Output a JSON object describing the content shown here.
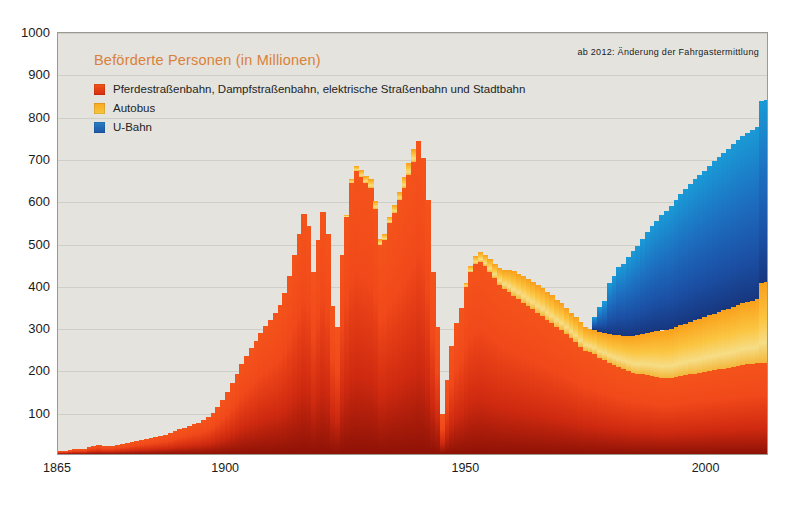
{
  "chart_data": {
    "type": "area",
    "title": "Beförderte Personen (in Millionen)",
    "xlabel": "",
    "ylabel": "",
    "ylim": [
      0,
      1000
    ],
    "xlim": [
      1865,
      2013
    ],
    "grid": true,
    "legend_position": "top-left",
    "annotation": "ab 2012: Änderung der Fahrgastermittlung",
    "y_ticks": [
      1000,
      900,
      800,
      700,
      600,
      500,
      400,
      300,
      200,
      100
    ],
    "x_ticks": [
      1865,
      1900,
      1950,
      2000
    ],
    "colors": {
      "rail": "#ef4c18",
      "bus": "#f9ab25",
      "ubahn": "#1d62b4",
      "plot_background": "#e4e3de",
      "gridline": "#cfcec7",
      "title": "#d98139",
      "text": "#1b1b1b"
    },
    "series": [
      {
        "name": "Pferdestraßenbahn, Dampfstraßenbahn, elektrische Straßenbahn und Stadtbahn",
        "key": "rail",
        "color": "#ef4c18"
      },
      {
        "name": "Autobus",
        "key": "bus",
        "color": "#f9ab25"
      },
      {
        "name": "U-Bahn",
        "key": "ubahn",
        "color": "#1d62b4"
      }
    ],
    "x": [
      1865,
      1866,
      1867,
      1868,
      1869,
      1870,
      1871,
      1872,
      1873,
      1874,
      1875,
      1876,
      1877,
      1878,
      1879,
      1880,
      1881,
      1882,
      1883,
      1884,
      1885,
      1886,
      1887,
      1888,
      1889,
      1890,
      1891,
      1892,
      1893,
      1894,
      1895,
      1896,
      1897,
      1898,
      1899,
      1900,
      1901,
      1902,
      1903,
      1904,
      1905,
      1906,
      1907,
      1908,
      1909,
      1910,
      1911,
      1912,
      1913,
      1914,
      1915,
      1916,
      1917,
      1918,
      1919,
      1920,
      1921,
      1922,
      1923,
      1924,
      1925,
      1926,
      1927,
      1928,
      1929,
      1930,
      1931,
      1932,
      1933,
      1934,
      1935,
      1936,
      1937,
      1938,
      1939,
      1940,
      1941,
      1942,
      1943,
      1944,
      1945,
      1946,
      1947,
      1948,
      1949,
      1950,
      1951,
      1952,
      1953,
      1954,
      1955,
      1956,
      1957,
      1958,
      1959,
      1960,
      1961,
      1962,
      1963,
      1964,
      1965,
      1966,
      1967,
      1968,
      1969,
      1970,
      1971,
      1972,
      1973,
      1974,
      1975,
      1976,
      1977,
      1978,
      1979,
      1980,
      1981,
      1982,
      1983,
      1984,
      1985,
      1986,
      1987,
      1988,
      1989,
      1990,
      1991,
      1992,
      1993,
      1994,
      1995,
      1996,
      1997,
      1998,
      1999,
      2000,
      2001,
      2002,
      2003,
      2004,
      2005,
      2006,
      2007,
      2008,
      2009,
      2010,
      2011,
      2012,
      2013
    ],
    "values_rail": [
      6,
      8,
      10,
      12,
      12,
      13,
      16,
      20,
      22,
      20,
      19,
      20,
      22,
      24,
      26,
      28,
      30,
      33,
      36,
      38,
      40,
      43,
      46,
      50,
      54,
      58,
      62,
      66,
      70,
      74,
      80,
      88,
      98,
      112,
      128,
      146,
      168,
      190,
      212,
      232,
      250,
      268,
      286,
      302,
      318,
      334,
      352,
      380,
      420,
      470,
      520,
      568,
      540,
      430,
      505,
      572,
      520,
      350,
      300,
      470,
      560,
      640,
      668,
      655,
      640,
      630,
      580,
      495,
      505,
      545,
      570,
      600,
      630,
      660,
      690,
      740,
      700,
      600,
      430,
      300,
      95,
      175,
      255,
      310,
      345,
      395,
      430,
      450,
      455,
      445,
      430,
      415,
      400,
      390,
      382,
      374,
      366,
      358,
      350,
      342,
      334,
      326,
      318,
      310,
      300,
      292,
      284,
      274,
      264,
      254,
      244,
      240,
      236,
      228,
      222,
      216,
      210,
      205,
      200,
      196,
      192,
      190,
      188,
      186,
      184,
      182,
      180,
      180,
      180,
      182,
      184,
      186,
      188,
      190,
      192,
      194,
      196,
      198,
      200,
      202,
      204,
      206,
      208,
      210,
      212,
      212,
      214,
      214,
      216,
      218,
      220,
      300,
      300
    ],
    "values_bus": [
      0,
      0,
      0,
      0,
      0,
      0,
      0,
      0,
      0,
      0,
      0,
      0,
      0,
      0,
      0,
      0,
      0,
      0,
      0,
      0,
      0,
      0,
      0,
      0,
      0,
      0,
      0,
      0,
      0,
      0,
      0,
      0,
      0,
      0,
      0,
      0,
      0,
      0,
      0,
      0,
      0,
      0,
      0,
      0,
      0,
      0,
      0,
      0,
      0,
      0,
      0,
      0,
      0,
      0,
      0,
      0,
      0,
      0,
      0,
      0,
      5,
      10,
      14,
      16,
      18,
      20,
      18,
      14,
      14,
      16,
      18,
      20,
      24,
      28,
      30,
      0,
      0,
      0,
      0,
      0,
      0,
      0,
      0,
      0,
      0,
      10,
      14,
      18,
      22,
      26,
      30,
      34,
      40,
      46,
      52,
      58,
      60,
      62,
      64,
      64,
      66,
      66,
      66,
      66,
      64,
      64,
      62,
      60,
      60,
      58,
      56,
      56,
      58,
      60,
      64,
      68,
      72,
      76,
      80,
      84,
      88,
      92,
      96,
      100,
      104,
      108,
      112,
      114,
      116,
      118,
      120,
      122,
      124,
      126,
      128,
      130,
      132,
      134,
      136,
      138,
      140,
      142,
      144,
      146,
      148,
      150,
      152,
      190,
      190
    ],
    "values_ubahn": [
      0,
      0,
      0,
      0,
      0,
      0,
      0,
      0,
      0,
      0,
      0,
      0,
      0,
      0,
      0,
      0,
      0,
      0,
      0,
      0,
      0,
      0,
      0,
      0,
      0,
      0,
      0,
      0,
      0,
      0,
      0,
      0,
      0,
      0,
      0,
      0,
      0,
      0,
      0,
      0,
      0,
      0,
      0,
      0,
      0,
      0,
      0,
      0,
      0,
      0,
      0,
      0,
      0,
      0,
      0,
      0,
      0,
      0,
      0,
      0,
      0,
      0,
      0,
      0,
      0,
      0,
      0,
      0,
      0,
      0,
      0,
      0,
      0,
      0,
      0,
      0,
      0,
      0,
      0,
      0,
      0,
      0,
      0,
      0,
      0,
      0,
      0,
      0,
      0,
      0,
      0,
      0,
      0,
      0,
      0,
      0,
      0,
      0,
      0,
      0,
      0,
      0,
      0,
      0,
      0,
      0,
      0,
      0,
      0,
      0,
      0,
      0,
      30,
      60,
      75,
      120,
      140,
      160,
      170,
      185,
      200,
      210,
      225,
      240,
      250,
      262,
      272,
      280,
      290,
      300,
      310,
      318,
      326,
      334,
      340,
      346,
      352,
      360,
      366,
      372,
      378,
      384,
      390,
      396,
      400,
      404,
      408,
      430,
      430
    ]
  }
}
